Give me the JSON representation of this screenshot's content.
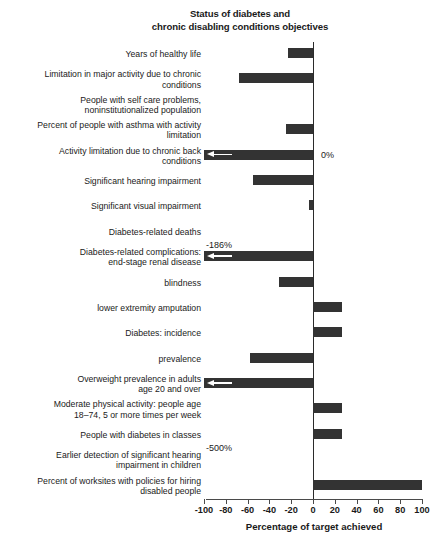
{
  "chart_data": {
    "type": "bar",
    "orientation": "horizontal",
    "title": "Status of diabetes and chronic disabling conditions objectives",
    "title_lines": [
      "Status of diabetes and",
      "chronic disabling conditions objectives"
    ],
    "xlabel": "Percentage of target achieved",
    "ylabel": "",
    "xlim": [
      -100,
      100
    ],
    "xticks": [
      -100,
      -80,
      -60,
      -40,
      -20,
      0,
      20,
      40,
      60,
      80,
      100
    ],
    "xtick_labels": [
      "-100",
      "-80",
      "-60",
      "-40",
      "-20",
      "0",
      "20",
      "40",
      "60",
      "80",
      "100"
    ],
    "grid": false,
    "legend": null,
    "bar_color": "#333333",
    "categories": [
      "Years of healthy life",
      "Limitation in major activity due to chronic conditions",
      "People with self care problems, noninstitutionalized population",
      "Percent of people with asthma with activity limitation",
      "Activity limitation due to chronic back conditions",
      "Significant hearing impairment",
      "Significant visual impairment",
      "Diabetes-related deaths",
      "Diabetes-related complications: end-stage renal disease",
      "blindness",
      "lower extremity amputation",
      "Diabetes: incidence",
      "prevalence",
      "Overweight prevalence in adults age 20 and over",
      "Moderate physical activity: people age 18–74, 5 or more times per week",
      "People with diabetes in classes",
      "Earlier detection of significant hearing impairment in children",
      "Percent of worksites with policies for hiring disabled people"
    ],
    "category_label_lines": [
      [
        "Years of healthy life"
      ],
      [
        "Limitation in major activity due to chronic",
        "conditions"
      ],
      [
        "People with self care problems,",
        "noninstitutionalized population"
      ],
      [
        "Percent of people with asthma with activity",
        "limitation"
      ],
      [
        "Activity limitation due to chronic back",
        "conditions"
      ],
      [
        "Significant hearing impairment"
      ],
      [
        "Significant visual impairment"
      ],
      [
        "Diabetes-related deaths"
      ],
      [
        "Diabetes-related complications:",
        "end-stage renal disease"
      ],
      [
        "blindness"
      ],
      [
        "lower extremity amputation"
      ],
      [
        "Diabetes: incidence"
      ],
      [
        "prevalence"
      ],
      [
        "Overweight prevalence in adults",
        "age 20 and over"
      ],
      [
        "Moderate physical activity: people age",
        "18–74, 5 or more times per week"
      ],
      [
        "People with diabetes in classes"
      ],
      [
        "Earlier detection of significant hearing",
        "impairment in children"
      ],
      [
        "Percent of worksites with policies for hiring",
        "disabled people"
      ]
    ],
    "values": [
      -23,
      -68,
      0,
      -25,
      -186,
      -55,
      -4,
      0,
      -500,
      -31,
      27,
      27,
      -58,
      -133,
      27,
      27,
      0,
      100
    ],
    "annotations": [
      {
        "index": 2,
        "text": "0%",
        "kind": "zero"
      },
      {
        "index": 4,
        "text": "-186%",
        "kind": "offscale"
      },
      {
        "index": 7,
        "text": "0%",
        "kind": "zero"
      },
      {
        "index": 8,
        "text": "-500%",
        "kind": "offscale"
      },
      {
        "index": 13,
        "text": "-133%",
        "kind": "offscale"
      },
      {
        "index": 16,
        "text": "0%",
        "kind": "zero"
      }
    ],
    "offscale_indices": [
      4,
      8,
      13
    ],
    "zero_value_indices": [
      2,
      7,
      16
    ]
  }
}
